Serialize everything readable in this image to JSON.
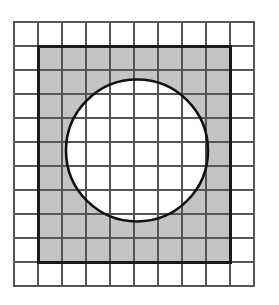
{
  "figure": {
    "canvas": {
      "width": 279,
      "height": 305,
      "background": "#ffffff"
    },
    "grid": {
      "name": "graph-paper-grid",
      "origin_x": 14,
      "origin_y": 22,
      "cell_size": 24,
      "columns": 10,
      "rows": 11,
      "line_color": "#555555",
      "line_width": 1.2,
      "border_color": "#555555",
      "border_width": 1.6,
      "fill": "#ffffff"
    },
    "shaded_square": {
      "name": "shaded-square",
      "x": 38,
      "y": 46,
      "width": 192,
      "height": 216,
      "columns_spanned": 8,
      "rows_spanned": 9,
      "fill": "#c4c4c4",
      "stroke": "#1a1a1a",
      "stroke_width": 3
    },
    "circle": {
      "name": "inscribed-circle",
      "center_x": 137,
      "center_y": 150.5,
      "radius": 71,
      "diameter": 142,
      "fill": "#ffffff",
      "stroke": "#111111",
      "stroke_width": 2.6
    }
  }
}
